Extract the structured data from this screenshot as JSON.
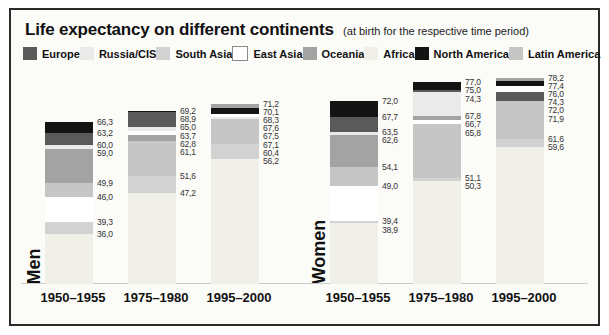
{
  "chart_data": {
    "type": "bar",
    "title": "Life expectancy on different continents",
    "subtitle": "(at birth for the respective time period)",
    "value_format": "decimal-comma",
    "ylim": [
      22.5,
      80
    ],
    "grid": false,
    "legend_position": "top",
    "legend": [
      {
        "name": "Europe",
        "color": "#5a5a5a"
      },
      {
        "name": "Russia/CIS",
        "color": "#eaeaea"
      },
      {
        "name": "South Asia",
        "color": "#d2d2d2"
      },
      {
        "name": "East Asia",
        "color": "#ffffff",
        "border": "#8a8a8a"
      },
      {
        "name": "Oceania",
        "color": "#a3a3a3"
      },
      {
        "name": "Africa",
        "color": "#f0efe8"
      },
      {
        "name": "North America",
        "color": "#141414"
      },
      {
        "name": "Latin America",
        "color": "#c6c6c6"
      }
    ],
    "groups": [
      {
        "label": "Men",
        "periods": [
          {
            "label": "1950–1955",
            "values": [
              {
                "continent": "North America",
                "value": 66.3
              },
              {
                "continent": "Europe",
                "value": 63.2
              },
              {
                "continent": "Russia/CIS",
                "value": 60.0
              },
              {
                "continent": "Oceania",
                "value": 59.0
              },
              {
                "continent": "Latin America",
                "value": 49.9
              },
              {
                "continent": "East Asia",
                "value": 46.0
              },
              {
                "continent": "South Asia",
                "value": 39.3
              },
              {
                "continent": "Africa",
                "value": 36.0
              }
            ]
          },
          {
            "label": "1975–1980",
            "values": [
              {
                "continent": "North America",
                "value": 69.2
              },
              {
                "continent": "Europe",
                "value": 68.9
              },
              {
                "continent": "Russia/CIS",
                "value": 65.0
              },
              {
                "continent": "East Asia",
                "value": 63.7
              },
              {
                "continent": "Oceania",
                "value": 62.8
              },
              {
                "continent": "Latin America",
                "value": 61.1
              },
              {
                "continent": "South Asia",
                "value": 51.6
              },
              {
                "continent": "Africa",
                "value": 47.2
              }
            ]
          },
          {
            "label": "1995–2000",
            "values": [
              {
                "continent": "Oceania",
                "value": 71.2
              },
              {
                "continent": "North America",
                "value": 70.1
              },
              {
                "continent": "East Asia",
                "value": 68.3
              },
              {
                "continent": "Europe",
                "value": 67.6
              },
              {
                "continent": "Russia/CIS",
                "value": 67.5
              },
              {
                "continent": "Latin America",
                "value": 67.1
              },
              {
                "continent": "South Asia",
                "value": 60.4
              },
              {
                "continent": "Africa",
                "value": 56.2
              }
            ]
          }
        ]
      },
      {
        "label": "Women",
        "periods": [
          {
            "label": "1950–1955",
            "values": [
              {
                "continent": "North America",
                "value": 72.0
              },
              {
                "continent": "Europe",
                "value": 67.7
              },
              {
                "continent": "Russia/CIS",
                "value": 63.5
              },
              {
                "continent": "Oceania",
                "value": 62.6
              },
              {
                "continent": "Latin America",
                "value": 54.1
              },
              {
                "continent": "East Asia",
                "value": 49.0
              },
              {
                "continent": "South Asia",
                "value": 39.4
              },
              {
                "continent": "Africa",
                "value": 38.9
              }
            ]
          },
          {
            "label": "1975–1980",
            "values": [
              {
                "continent": "North America",
                "value": 77.0
              },
              {
                "continent": "Europe",
                "value": 75.0
              },
              {
                "continent": "Russia/CIS",
                "value": 74.3
              },
              {
                "continent": "Oceania",
                "value": 67.8
              },
              {
                "continent": "East Asia",
                "value": 66.7
              },
              {
                "continent": "Latin America",
                "value": 65.8
              },
              {
                "continent": "South Asia",
                "value": 51.1
              },
              {
                "continent": "Africa",
                "value": 50.3
              }
            ]
          },
          {
            "label": "1995–2000",
            "values": [
              {
                "continent": "Oceania",
                "value": 78.2
              },
              {
                "continent": "North America",
                "value": 77.4
              },
              {
                "continent": "East Asia",
                "value": 76.0
              },
              {
                "continent": "Europe",
                "value": 74.3
              },
              {
                "continent": "Russia/CIS",
                "value": 72.0
              },
              {
                "continent": "Latin America",
                "value": 71.9
              },
              {
                "continent": "South Asia",
                "value": 61.6
              },
              {
                "continent": "Africa",
                "value": 59.6
              }
            ]
          }
        ]
      }
    ]
  }
}
